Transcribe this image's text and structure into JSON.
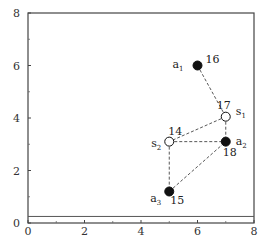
{
  "chart_data": {
    "type": "scatter",
    "title": "",
    "xlabel": "",
    "ylabel": "",
    "xlim": [
      0,
      8
    ],
    "ylim": [
      0,
      8
    ],
    "grid": false,
    "x_ticks": [
      "0",
      "2",
      "4",
      "6",
      "8"
    ],
    "y_ticks": [
      "0",
      "2",
      "4",
      "6",
      "8"
    ],
    "baseline_y": 0.25,
    "points": [
      {
        "id": "a1",
        "name": "a",
        "sub": "1",
        "x": 6.0,
        "y": 6.0,
        "value": "16",
        "filled": true
      },
      {
        "id": "s1",
        "name": "s",
        "sub": "1",
        "x": 7.0,
        "y": 4.05,
        "value": "17",
        "filled": false
      },
      {
        "id": "a2",
        "name": "a",
        "sub": "2",
        "x": 7.0,
        "y": 3.1,
        "value": "18",
        "filled": true
      },
      {
        "id": "s2",
        "name": "s",
        "sub": "2",
        "x": 5.0,
        "y": 3.1,
        "value": "14",
        "filled": false
      },
      {
        "id": "a3",
        "name": "a",
        "sub": "3",
        "x": 5.0,
        "y": 1.2,
        "value": "15",
        "filled": true
      }
    ],
    "edges": [
      [
        "a1",
        "s1"
      ],
      [
        "s1",
        "a2"
      ],
      [
        "s1",
        "s2"
      ],
      [
        "s2",
        "a2"
      ],
      [
        "s2",
        "a3"
      ],
      [
        "a3",
        "a2"
      ]
    ]
  }
}
